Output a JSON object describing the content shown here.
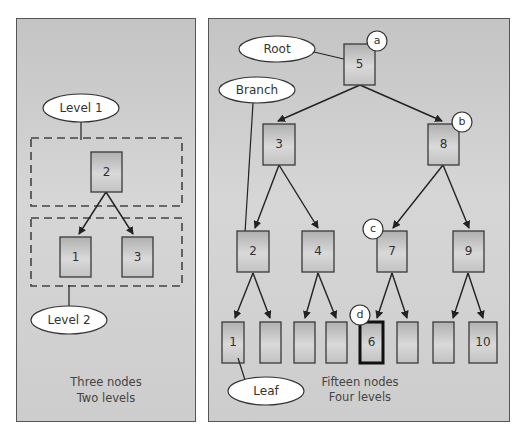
{
  "left_panel": {
    "labels": {
      "level1": "Level 1",
      "level2": "Level 2"
    },
    "nodes": {
      "root": "2",
      "left": "1",
      "right": "3"
    },
    "caption": {
      "line1": "Three nodes",
      "line2": "Two levels"
    }
  },
  "right_panel": {
    "labels": {
      "root": "Root",
      "branch": "Branch",
      "leaf": "Leaf"
    },
    "badges": {
      "a": "a",
      "b": "b",
      "c": "c",
      "d": "d"
    },
    "nodes": {
      "l1": "5",
      "l2a": "3",
      "l2b": "8",
      "l3a": "2",
      "l3b": "4",
      "l3c": "7",
      "l3d": "9",
      "l4a": "1",
      "l4b": "",
      "l4c": "",
      "l4d": "",
      "l4e": "6",
      "l4f": "",
      "l4g": "",
      "l4h": "10"
    },
    "caption": {
      "line1": "Fifteen nodes",
      "line2": "Four levels"
    }
  },
  "colors": {
    "panel_bg": "#cccccc",
    "node_fill_top": "#b4b4b4",
    "node_fill_mid": "#d8d8d8",
    "border": "#333333"
  }
}
